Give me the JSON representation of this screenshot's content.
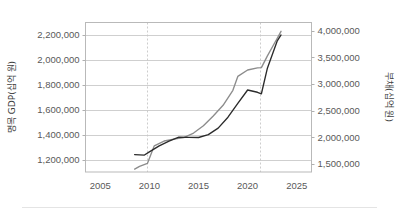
{
  "chart_data": {
    "type": "line",
    "title": "",
    "xlabel": "",
    "ylabel": "명목 GDP(십억 원)",
    "y2label": "부채(십억 원)",
    "grid": true,
    "legend": "none",
    "xlim": [
      2003.5,
      2026.5
    ],
    "xticks": [
      "2005",
      "2010",
      "2015",
      "2020",
      "2025"
    ],
    "xtick_values": [
      2005,
      2010,
      2015,
      2020,
      2025
    ],
    "ylim": [
      1100000,
      2300000
    ],
    "yticks": [
      "1,200,000",
      "1,400,000",
      "1,600,000",
      "1,800,000",
      "2,000,000",
      "2,200,000"
    ],
    "ytick_values": [
      1200000,
      1400000,
      1600000,
      1800000,
      2000000,
      2200000
    ],
    "y2lim": [
      1350000,
      4150000
    ],
    "y2ticks": [
      "1,500,000",
      "2,000,000",
      "2,500,000",
      "3,000,000",
      "3,500,000",
      "4,000,000"
    ],
    "y2tick_values": [
      1500000,
      2000000,
      2500000,
      3000000,
      3500000,
      4000000
    ],
    "annotations": [
      {
        "type": "vline",
        "x": 2009.8,
        "style": "dashed"
      },
      {
        "type": "vline",
        "x": 2021.3,
        "style": "dashed"
      }
    ],
    "series": [
      {
        "name": "명목 GDP(십억 원)",
        "axis": "left",
        "color": "#2b2b2b",
        "x": [
          2008.5,
          2009.0,
          2009.5,
          2010.0,
          2011.0,
          2012.0,
          2013.0,
          2014.0,
          2015.0,
          2016.0,
          2017.0,
          2018.0,
          2019.0,
          2020.0,
          2021.0,
          2021.4,
          2022.0,
          2023.0,
          2023.4
        ],
        "values": [
          1240000,
          1238000,
          1236000,
          1262000,
          1310000,
          1348000,
          1380000,
          1378000,
          1377000,
          1400000,
          1452000,
          1540000,
          1650000,
          1758000,
          1740000,
          1728000,
          1930000,
          2150000,
          2200000
        ]
      },
      {
        "name": "부채(십억 원)",
        "axis": "right",
        "color": "#8c8c8c",
        "x": [
          2008.5,
          2009.0,
          2009.8,
          2010.5,
          2011.5,
          2012.5,
          2013.5,
          2014.5,
          2015.5,
          2016.5,
          2017.5,
          2018.5,
          2019.0,
          2020.0,
          2021.0,
          2021.4,
          2022.0,
          2023.0,
          2023.4
        ],
        "values": [
          1405000,
          1455000,
          1510000,
          1840000,
          1930000,
          1965000,
          1995000,
          2080000,
          2215000,
          2400000,
          2600000,
          2880000,
          3140000,
          3260000,
          3300000,
          3305000,
          3520000,
          3850000,
          3985000
        ]
      }
    ]
  },
  "axes": {
    "left_title": "명목 GDP(십억 원)",
    "right_title": "부채(십억 원)"
  }
}
